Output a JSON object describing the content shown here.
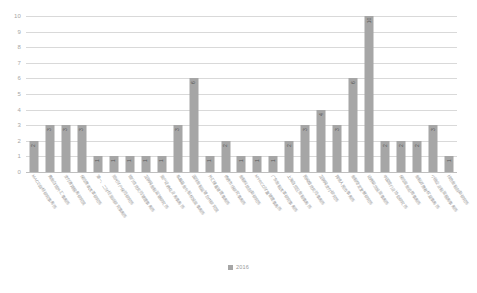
{
  "chart_data": {
    "type": "bar",
    "title": "",
    "xlabel": "",
    "ylabel": "",
    "ylim": [
      0,
      10
    ],
    "ytick_step": 1,
    "yticks": [
      "0",
      "1",
      "2",
      "3",
      "4",
      "5",
      "6",
      "7",
      "8",
      "9",
      "10"
    ],
    "grid": true,
    "legend_position": "bottom",
    "series": [
      {
        "name": "2016",
        "color": "#a6a6a6",
        "values": [
          2,
          3,
          3,
          3,
          1,
          1,
          1,
          1,
          1,
          3,
          6,
          1,
          2,
          1,
          1,
          1,
          2,
          3,
          4,
          3,
          6,
          10,
          2,
          2,
          2,
          3,
          1
        ]
      }
    ],
    "categories": [
      "MACD指标研究事务所",
      "黄金白银外汇事务所",
      "支付清算服务研究院",
      "保险费率改革研究所",
      "第一、二财经资讯研究事务所",
      "阳光财产保险研究所",
      "银行信贷风险管理事务所",
      "互联网金融监管研究所",
      "资产证券化业务事务所",
      "私募基金与股权投资事务所",
      "国际金融监管合作研究院",
      "外汇储备管理事务所",
      "债券市场研究事务所",
      "金融科技创新研究所",
      "MYRCD财富管理事务所",
      "广东金融改革研究事务所",
      "上海自贸区金融事务所",
      "民间借贷风险事务所",
      "互联网支付研究所",
      "跨境人民币事务所",
      "金融稳定发展研究所",
      "证券期货投资事务所",
      "中国银行业协会研究所",
      "保险资金运用事务所",
      "金融消费者权益事务所",
      "小微企业融资服务事务所",
      "绿色金融创新研究所"
    ],
    "value_labels_visible": true,
    "legend_entries": [
      "2016"
    ]
  },
  "legend": {
    "label": "2016"
  }
}
